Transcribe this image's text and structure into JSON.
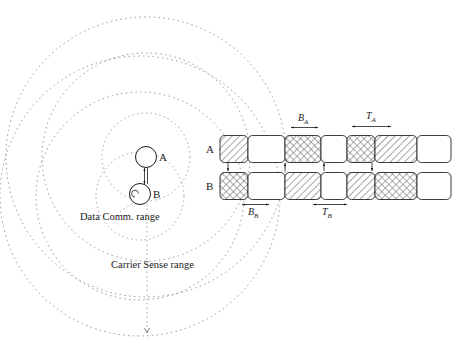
{
  "figure": {
    "left_panel": {
      "nodes": [
        {
          "id": "A",
          "label": "A",
          "cx": 146,
          "cy": 157,
          "r": 10.5
        },
        {
          "id": "B",
          "label": "B",
          "cx": 140,
          "cy": 193,
          "r": 10.5
        }
      ],
      "range_labels": [
        {
          "id": "data-comm",
          "text": "Data Comm. range",
          "x": 80,
          "y": 220
        },
        {
          "id": "carrier-sense",
          "text": "Carrier Sense range",
          "x": 111,
          "y": 268
        }
      ],
      "circles": [
        {
          "id": "data-range-a",
          "cx": 146,
          "cy": 157,
          "r": 42
        },
        {
          "id": "data-range-b",
          "cx": 140,
          "cy": 193,
          "r": 42
        },
        {
          "id": "carrier-range-a",
          "cx": 146,
          "cy": 157,
          "r": 105
        },
        {
          "id": "carrier-range-b",
          "cx": 140,
          "cy": 193,
          "r": 105
        },
        {
          "id": "carrier-outer-a",
          "cx": 146,
          "cy": 157,
          "r": 140
        },
        {
          "id": "carrier-outer-b",
          "cx": 140,
          "cy": 193,
          "r": 140
        }
      ],
      "link_arrow": {
        "id": "a-b-link",
        "x": 146,
        "y1": 168,
        "y2": 183
      }
    },
    "timing_diagram": {
      "rows": [
        {
          "id": "row-a",
          "label": "A",
          "label_x": 207,
          "label_y": 160,
          "y": 135,
          "height": 27
        },
        {
          "id": "row-b",
          "label": "B",
          "label_x": 207,
          "label_y": 196,
          "y": 172,
          "height": 27
        }
      ],
      "axis": {
        "label": "t",
        "x": 441,
        "y": 194
      },
      "measures": [
        {
          "id": "B_A",
          "base": "B",
          "sub": "A",
          "x": 302,
          "y": 120,
          "x1": 288,
          "x2": 320,
          "ay": 127
        },
        {
          "id": "T_A",
          "base": "T",
          "sub": "A",
          "x": 370,
          "y": 118,
          "x1": 350,
          "x2": 391,
          "ay": 125
        },
        {
          "id": "B_B",
          "base": "B",
          "sub": "B",
          "x": 253,
          "y": 212,
          "x1": 240,
          "x2": 268,
          "ay": 203
        },
        {
          "id": "T_B",
          "base": "T",
          "sub": "B",
          "x": 328,
          "y": 212,
          "x1": 311,
          "x2": 348,
          "ay": 203
        }
      ],
      "row_a_blocks": [
        {
          "id": "a-blk-1",
          "fill": "diagonal",
          "x": 220,
          "w": 28
        },
        {
          "id": "a-blk-2",
          "fill": "empty",
          "x": 248,
          "w": 37
        },
        {
          "id": "a-blk-3",
          "fill": "cross",
          "x": 285,
          "w": 36
        },
        {
          "id": "a-blk-4",
          "fill": "empty",
          "x": 321,
          "w": 26
        },
        {
          "id": "a-blk-5",
          "fill": "cross",
          "x": 347,
          "w": 28
        },
        {
          "id": "a-blk-6",
          "fill": "diagonal",
          "x": 375,
          "w": 42
        },
        {
          "id": "a-blk-7",
          "fill": "empty",
          "x": 417,
          "w": 34
        }
      ],
      "row_b_blocks": [
        {
          "id": "b-blk-1",
          "fill": "cross",
          "x": 220,
          "w": 28
        },
        {
          "id": "b-blk-2",
          "fill": "empty",
          "x": 248,
          "w": 37
        },
        {
          "id": "b-blk-3",
          "fill": "diagonal",
          "x": 285,
          "w": 36
        },
        {
          "id": "b-blk-4",
          "fill": "empty",
          "x": 321,
          "w": 26
        },
        {
          "id": "b-blk-5",
          "fill": "diagonal",
          "x": 347,
          "w": 28
        },
        {
          "id": "b-blk-6",
          "fill": "cross",
          "x": 375,
          "w": 42
        },
        {
          "id": "b-blk-7",
          "fill": "empty",
          "x": 417,
          "w": 34
        }
      ],
      "inter_row_arrows": [
        {
          "id": "arrow-down-1",
          "x": 228,
          "dir": "down"
        },
        {
          "id": "arrow-up-1",
          "x": 285,
          "dir": "up"
        },
        {
          "id": "arrow-up-2",
          "x": 324,
          "dir": "up"
        },
        {
          "id": "arrow-down-2",
          "x": 372,
          "dir": "down"
        }
      ]
    },
    "colors": {
      "stroke": "#1a1a1a",
      "dotted": "#8a8a8a",
      "background": "#ffffff"
    }
  }
}
